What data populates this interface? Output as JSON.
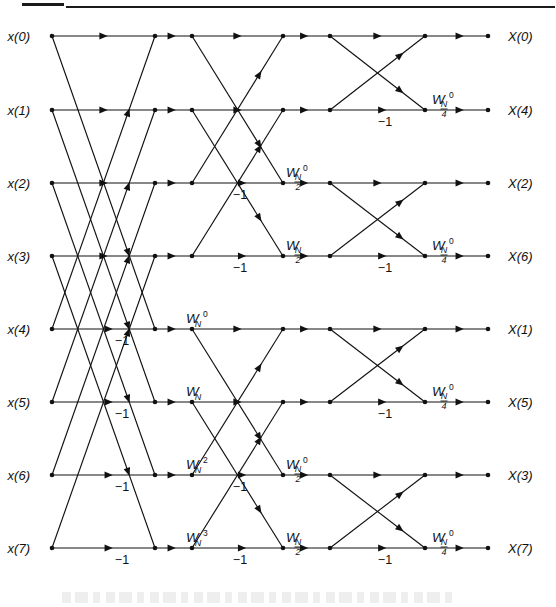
{
  "figure": {
    "stages": 3,
    "points": 8
  },
  "inputs": [
    {
      "id": "x0",
      "label": "x(0)",
      "row": 0
    },
    {
      "id": "x1",
      "label": "x(1)",
      "row": 1
    },
    {
      "id": "x2",
      "label": "x(2)",
      "row": 2
    },
    {
      "id": "x3",
      "label": "x(3)",
      "row": 3
    },
    {
      "id": "x4",
      "label": "x(4)",
      "row": 4
    },
    {
      "id": "x5",
      "label": "x(5)",
      "row": 5
    },
    {
      "id": "x6",
      "label": "x(6)",
      "row": 6
    },
    {
      "id": "x7",
      "label": "x(7)",
      "row": 7
    }
  ],
  "outputs": [
    {
      "id": "X0",
      "label": "X(0)",
      "row": 0
    },
    {
      "id": "X4",
      "label": "X(4)",
      "row": 1
    },
    {
      "id": "X2",
      "label": "X(2)",
      "row": 2
    },
    {
      "id": "X6",
      "label": "X(6)",
      "row": 3
    },
    {
      "id": "X1",
      "label": "X(1)",
      "row": 4
    },
    {
      "id": "X5",
      "label": "X(5)",
      "row": 5
    },
    {
      "id": "X3",
      "label": "X(3)",
      "row": 6
    },
    {
      "id": "X7",
      "label": "X(7)",
      "row": 7
    }
  ],
  "negative_one_labels": [
    {
      "text": "-1",
      "x": 122,
      "row": 4
    },
    {
      "text": "-1",
      "x": 122,
      "row": 5
    },
    {
      "text": "-1",
      "x": 122,
      "row": 6
    },
    {
      "text": "-1",
      "x": 122,
      "row": 7
    },
    {
      "text": "-1",
      "x": 240,
      "row": 2
    },
    {
      "text": "-1",
      "x": 240,
      "row": 3
    },
    {
      "text": "-1",
      "x": 240,
      "row": 6
    },
    {
      "text": "-1",
      "x": 240,
      "row": 7
    },
    {
      "text": "-1",
      "x": 385,
      "row": 1
    },
    {
      "text": "-1",
      "x": 385,
      "row": 3
    },
    {
      "text": "-1",
      "x": 385,
      "row": 5
    },
    {
      "text": "-1",
      "x": 385,
      "row": 7
    }
  ],
  "twiddles": [
    {
      "base": "W",
      "sub": "N",
      "sup": "0",
      "sub_frac": null,
      "x": 186,
      "row": 4,
      "stage": 1
    },
    {
      "base": "W",
      "sub": "N",
      "sup": "",
      "sub_frac": null,
      "x": 186,
      "row": 5,
      "stage": 1
    },
    {
      "base": "W",
      "sub": "N",
      "sup": "2",
      "sub_frac": null,
      "x": 186,
      "row": 6,
      "stage": 1
    },
    {
      "base": "W",
      "sub": "N",
      "sup": "3",
      "sub_frac": null,
      "x": 186,
      "row": 7,
      "stage": 1
    },
    {
      "base": "W",
      "sub": "N",
      "sup": "0",
      "sub_frac": "2",
      "x": 286,
      "row": 2,
      "stage": 2
    },
    {
      "base": "W",
      "sub": "N",
      "sup": "",
      "sub_frac": "2",
      "x": 286,
      "row": 3,
      "stage": 2
    },
    {
      "base": "W",
      "sub": "N",
      "sup": "0",
      "sub_frac": "2",
      "x": 286,
      "row": 6,
      "stage": 2
    },
    {
      "base": "W",
      "sub": "N",
      "sup": "",
      "sub_frac": "2",
      "x": 286,
      "row": 7,
      "stage": 2
    },
    {
      "base": "W",
      "sub": "N",
      "sup": "0",
      "sub_frac": "4",
      "x": 432,
      "row": 1,
      "stage": 3
    },
    {
      "base": "W",
      "sub": "N",
      "sup": "0",
      "sub_frac": "4",
      "x": 432,
      "row": 3,
      "stage": 3
    },
    {
      "base": "W",
      "sub": "N",
      "sup": "0",
      "sub_frac": "4",
      "x": 432,
      "row": 5,
      "stage": 3
    },
    {
      "base": "W",
      "sub": "N",
      "sup": "0",
      "sub_frac": "4",
      "x": 432,
      "row": 7,
      "stage": 3
    }
  ],
  "geometry": {
    "row_y": [
      36,
      110,
      183,
      256,
      329,
      402,
      475,
      548
    ],
    "col_x": [
      52,
      155,
      192,
      283,
      330,
      425,
      488
    ],
    "input_label_x": 30,
    "output_label_x": 508
  },
  "colors": {
    "ink": "#111111",
    "rule": "#1b1b1b",
    "background": "#ffffff"
  }
}
